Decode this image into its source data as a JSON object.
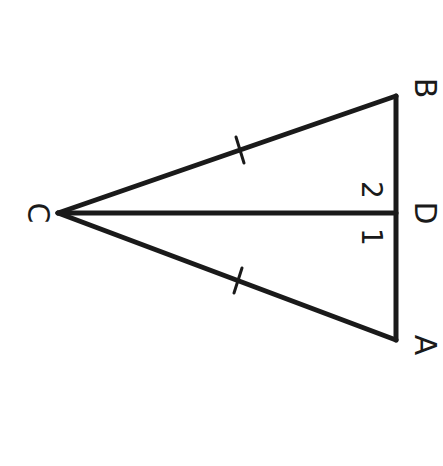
{
  "diagram": {
    "type": "geometry-triangle",
    "stroke_color": "#1a1a1a",
    "background": "#ffffff",
    "vertices": {
      "C": {
        "label": "C",
        "x": 58,
        "y": 213
      },
      "B": {
        "label": "B",
        "x": 396,
        "y": 96
      },
      "A": {
        "label": "A",
        "x": 396,
        "y": 340
      },
      "D": {
        "label": "D",
        "x": 396,
        "y": 213
      }
    },
    "segments": [
      "CB",
      "CA",
      "BA",
      "CD"
    ],
    "tick_marks": [
      "CB",
      "CA"
    ],
    "angle_labels": {
      "angle1": "1",
      "angle2": "2"
    }
  }
}
